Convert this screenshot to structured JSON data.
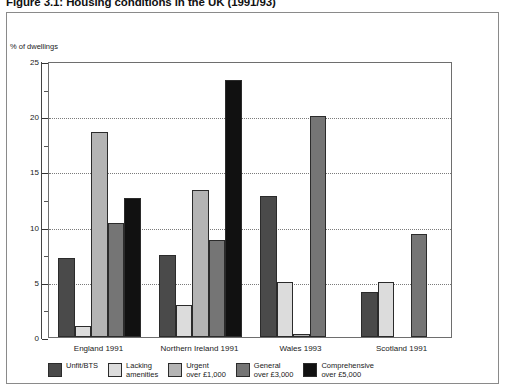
{
  "figure": {
    "title": "Figure 3.1: Housing conditions in the UK (1991/93)",
    "y_axis_title": "% of dwellings"
  },
  "chart_data": {
    "type": "bar",
    "title": "Figure 3.1: Housing conditions in the UK (1991/93)",
    "xlabel": "",
    "ylabel": "% of dwellings",
    "ylim": [
      0,
      25
    ],
    "yticks": [
      0,
      5,
      10,
      15,
      20,
      25
    ],
    "ytick_labels": [
      "0",
      "5",
      "10",
      "15",
      "20",
      "25"
    ],
    "yminor_step": 2.5,
    "grid": "horizontal-dotted",
    "legend_position": "bottom",
    "categories": [
      "England 1991",
      "Northern Ireland 1991",
      "Wales 1993",
      "Scotland 1991"
    ],
    "series": [
      {
        "name": "Unfit/BTS",
        "color": "#4a4a4a",
        "values": [
          7.2,
          7.4,
          12.8,
          4.1
        ]
      },
      {
        "name": "Lacking amenities",
        "color": "#dcdcdc",
        "values": [
          1.0,
          2.9,
          5.0,
          5.0
        ]
      },
      {
        "name": "Urgent over £1,000",
        "color": "#b4b4b4",
        "values": [
          18.6,
          13.3,
          0.3,
          0.0
        ]
      },
      {
        "name": "General over £3,000",
        "color": "#757575",
        "values": [
          10.3,
          8.8,
          20.0,
          9.3
        ]
      },
      {
        "name": "Comprehensive over £5,000",
        "color": "#111111",
        "values": [
          12.6,
          23.3,
          0.0,
          0.0
        ]
      }
    ],
    "legend": [
      {
        "label_line1": "Unfit/BTS",
        "label_line2": "",
        "color": "#4a4a4a"
      },
      {
        "label_line1": "Lacking",
        "label_line2": "amenities",
        "color": "#dcdcdc"
      },
      {
        "label_line1": "Urgent",
        "label_line2": "over £1,000",
        "color": "#b4b4b4"
      },
      {
        "label_line1": "General",
        "label_line2": "over £3,000",
        "color": "#757575"
      },
      {
        "label_line1": "Comprehensive",
        "label_line2": "over £5,000",
        "color": "#111111"
      }
    ]
  }
}
